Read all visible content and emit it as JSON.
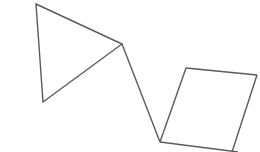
{
  "canvas": {
    "width": 260,
    "height": 152,
    "background": "#ffffff"
  },
  "style": {
    "stroke_color": "#5a5a5a",
    "stroke_width": 1.4
  },
  "shapes": {
    "triangle": {
      "points": "36,4 122,44 43,102"
    },
    "connector": {
      "x1": 122,
      "y1": 44,
      "x2": 160,
      "y2": 142
    },
    "parallelogram": {
      "points": "160,142 186,68 257,75 231,152",
      "top_edge": "186,68 257,75",
      "left_edge": "160,142 186,68",
      "right_edge": "257,75 232,152",
      "bottom_edge": "160,142 238,152"
    }
  }
}
